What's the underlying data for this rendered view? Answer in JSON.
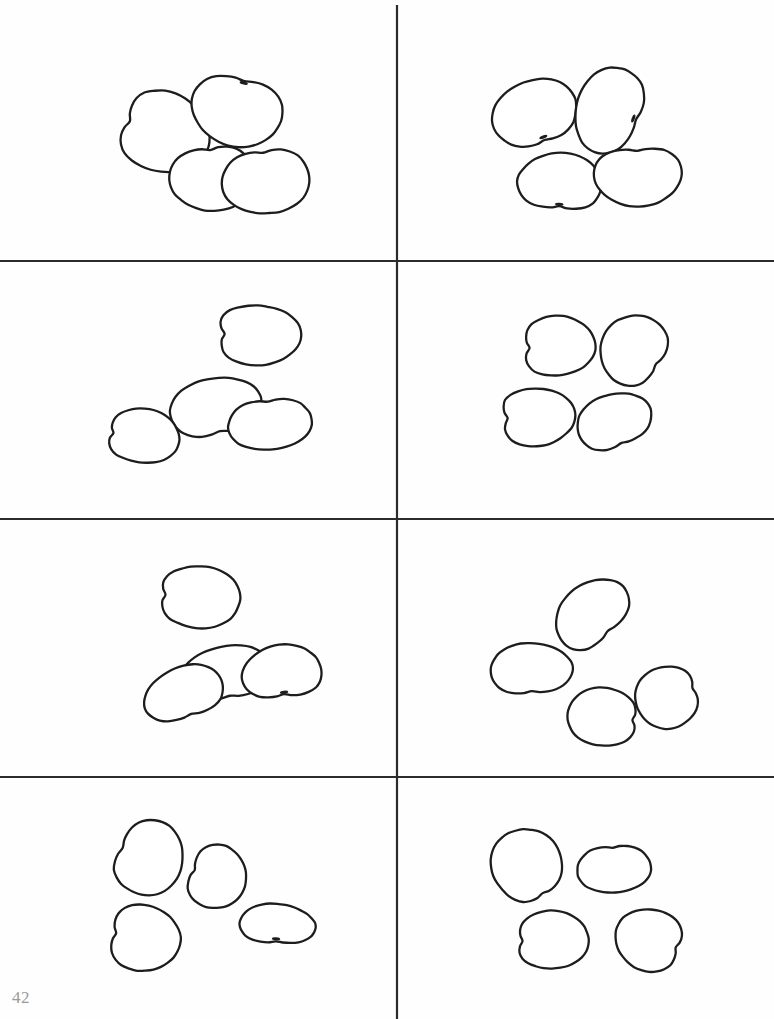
{
  "page": {
    "page_number": "42",
    "width": 774,
    "height": 1019,
    "background_color": "#fefefe",
    "ink_color": "#1d1d1d",
    "page_number_color": "#9a9a9a"
  },
  "grid": {
    "columns": 2,
    "rows": 4,
    "line_color": "#2b2b2b",
    "line_width": 2.2,
    "vertical_lines": [
      {
        "x": 397,
        "y1": 5,
        "y2": 1019
      }
    ],
    "horizontal_lines": [
      {
        "y": 261,
        "x1": 0,
        "x2": 774
      },
      {
        "y": 519,
        "x1": 0,
        "x2": 774
      },
      {
        "y": 777,
        "x1": 0,
        "x2": 774
      }
    ]
  },
  "cells": [
    {
      "id": "cell-1",
      "row": 1,
      "column": 1,
      "object_name": "bean",
      "count": 4,
      "bounds": {
        "x": 0,
        "y": 0,
        "width": 397,
        "height": 261
      }
    },
    {
      "id": "cell-2",
      "row": 1,
      "column": 2,
      "object_name": "bean",
      "count": 4,
      "bounds": {
        "x": 397,
        "y": 0,
        "width": 377,
        "height": 261
      }
    },
    {
      "id": "cell-3",
      "row": 2,
      "column": 1,
      "object_name": "bean",
      "count": 4,
      "bounds": {
        "x": 0,
        "y": 261,
        "width": 397,
        "height": 258
      }
    },
    {
      "id": "cell-4",
      "row": 2,
      "column": 2,
      "object_name": "bean",
      "count": 4,
      "bounds": {
        "x": 397,
        "y": 261,
        "width": 377,
        "height": 258
      }
    },
    {
      "id": "cell-5",
      "row": 3,
      "column": 1,
      "object_name": "bean",
      "count": 4,
      "bounds": {
        "x": 0,
        "y": 519,
        "width": 397,
        "height": 258
      }
    },
    {
      "id": "cell-6",
      "row": 3,
      "column": 2,
      "object_name": "bean",
      "count": 4,
      "bounds": {
        "x": 397,
        "y": 519,
        "width": 377,
        "height": 258
      }
    },
    {
      "id": "cell-7",
      "row": 4,
      "column": 1,
      "object_name": "bean",
      "count": 4,
      "bounds": {
        "x": 0,
        "y": 777,
        "width": 397,
        "height": 242
      }
    },
    {
      "id": "cell-8",
      "row": 4,
      "column": 2,
      "object_name": "bean",
      "count": 4,
      "bounds": {
        "x": 397,
        "y": 777,
        "width": 377,
        "height": 242
      }
    }
  ],
  "beans": [
    {
      "cell": "cell-1",
      "index": 0,
      "cx": 163,
      "cy": 132,
      "rx": 47,
      "ry": 40,
      "rotation": 18,
      "notch": 0.46,
      "hilum": false
    },
    {
      "cell": "cell-1",
      "index": 1,
      "cx": 237,
      "cy": 110,
      "rx": 36,
      "ry": 46,
      "rotation": 104,
      "notch": 0.3,
      "hilum": true
    },
    {
      "cell": "cell-1",
      "index": 2,
      "cx": 212,
      "cy": 177,
      "rx": 34,
      "ry": 42,
      "rotation": 86,
      "notch": 0.38,
      "hilum": false
    },
    {
      "cell": "cell-1",
      "index": 3,
      "cx": 266,
      "cy": 180,
      "rx": 34,
      "ry": 44,
      "rotation": 84,
      "notch": 0.4,
      "hilum": false
    },
    {
      "cell": "cell-2",
      "index": 0,
      "cx": 535,
      "cy": 114,
      "rx": 34,
      "ry": 43,
      "rotation": 250,
      "notch": 0.4,
      "hilum": true
    },
    {
      "cell": "cell-2",
      "index": 1,
      "cx": 610,
      "cy": 110,
      "rx": 34,
      "ry": 44,
      "rotation": 200,
      "notch": 0.38,
      "hilum": true
    },
    {
      "cell": "cell-2",
      "index": 2,
      "cx": 560,
      "cy": 183,
      "rx": 30,
      "ry": 42,
      "rotation": 272,
      "notch": 0.4,
      "hilum": true
    },
    {
      "cell": "cell-2",
      "index": 3,
      "cx": 638,
      "cy": 175,
      "rx": 31,
      "ry": 44,
      "rotation": 88,
      "notch": 0.38,
      "hilum": false
    },
    {
      "cell": "cell-3",
      "index": 0,
      "cx": 257,
      "cy": 335,
      "rx": 44,
      "ry": 30,
      "rotation": 2,
      "notch": 0.5,
      "hilum": false
    },
    {
      "cell": "cell-3",
      "index": 1,
      "cx": 215,
      "cy": 408,
      "rx": 30,
      "ry": 46,
      "rotation": 258,
      "notch": 0.42,
      "hilum": false
    },
    {
      "cell": "cell-3",
      "index": 2,
      "cx": 270,
      "cy": 423,
      "rx": 27,
      "ry": 42,
      "rotation": 84,
      "notch": 0.44,
      "hilum": false
    },
    {
      "cell": "cell-3",
      "index": 3,
      "cx": 142,
      "cy": 436,
      "rx": 38,
      "ry": 27,
      "rotation": 6,
      "notch": 0.5,
      "hilum": false
    },
    {
      "cell": "cell-4",
      "index": 0,
      "cx": 557,
      "cy": 346,
      "rx": 38,
      "ry": 30,
      "rotation": 356,
      "notch": 0.5,
      "hilum": false
    },
    {
      "cell": "cell-4",
      "index": 1,
      "cx": 634,
      "cy": 350,
      "rx": 33,
      "ry": 36,
      "rotation": 214,
      "notch": 0.36,
      "hilum": false
    },
    {
      "cell": "cell-4",
      "index": 2,
      "cx": 536,
      "cy": 417,
      "rx": 39,
      "ry": 29,
      "rotation": 358,
      "notch": 0.5,
      "hilum": false
    },
    {
      "cell": "cell-4",
      "index": 3,
      "cx": 614,
      "cy": 422,
      "rx": 28,
      "ry": 38,
      "rotation": 250,
      "notch": 0.42,
      "hilum": false
    },
    {
      "cell": "cell-5",
      "index": 0,
      "cx": 198,
      "cy": 597,
      "rx": 43,
      "ry": 31,
      "rotation": 4,
      "notch": 0.5,
      "hilum": false
    },
    {
      "cell": "cell-5",
      "index": 1,
      "cx": 226,
      "cy": 674,
      "rx": 28,
      "ry": 45,
      "rotation": 260,
      "notch": 0.44,
      "hilum": false
    },
    {
      "cell": "cell-5",
      "index": 2,
      "cx": 184,
      "cy": 694,
      "rx": 27,
      "ry": 41,
      "rotation": 250,
      "notch": 0.42,
      "hilum": false
    },
    {
      "cell": "cell-5",
      "index": 3,
      "cx": 282,
      "cy": 673,
      "rx": 28,
      "ry": 40,
      "rotation": 264,
      "notch": 0.42,
      "hilum": true
    },
    {
      "cell": "cell-6",
      "index": 0,
      "cx": 592,
      "cy": 614,
      "rx": 30,
      "ry": 41,
      "rotation": 228,
      "notch": 0.4,
      "hilum": false
    },
    {
      "cell": "cell-6",
      "index": 1,
      "cx": 531,
      "cy": 670,
      "rx": 27,
      "ry": 41,
      "rotation": 268,
      "notch": 0.42,
      "hilum": false
    },
    {
      "cell": "cell-6",
      "index": 2,
      "cx": 604,
      "cy": 717,
      "rx": 37,
      "ry": 29,
      "rotation": 186,
      "notch": 0.46,
      "hilum": false
    },
    {
      "cell": "cell-6",
      "index": 3,
      "cx": 668,
      "cy": 697,
      "rx": 33,
      "ry": 31,
      "rotation": 160,
      "notch": 0.44,
      "hilum": false
    },
    {
      "cell": "cell-7",
      "index": 0,
      "cx": 148,
      "cy": 858,
      "rx": 35,
      "ry": 38,
      "rotation": 22,
      "notch": 0.44,
      "hilum": false
    },
    {
      "cell": "cell-7",
      "index": 1,
      "cx": 216,
      "cy": 877,
      "rx": 30,
      "ry": 32,
      "rotation": 18,
      "notch": 0.44,
      "hilum": false
    },
    {
      "cell": "cell-7",
      "index": 2,
      "cx": 143,
      "cy": 938,
      "rx": 37,
      "ry": 33,
      "rotation": 10,
      "notch": 0.46,
      "hilum": false
    },
    {
      "cell": "cell-7",
      "index": 3,
      "cx": 277,
      "cy": 925,
      "rx": 21,
      "ry": 38,
      "rotation": 274,
      "notch": 0.42,
      "hilum": true
    },
    {
      "cell": "cell-8",
      "index": 0,
      "cx": 527,
      "cy": 866,
      "rx": 38,
      "ry": 35,
      "rotation": 240,
      "notch": 0.38,
      "hilum": false
    },
    {
      "cell": "cell-8",
      "index": 1,
      "cx": 614,
      "cy": 868,
      "rx": 25,
      "ry": 37,
      "rotation": 86,
      "notch": 0.4,
      "hilum": false
    },
    {
      "cell": "cell-8",
      "index": 2,
      "cx": 551,
      "cy": 940,
      "rx": 38,
      "ry": 29,
      "rotation": 358,
      "notch": 0.5,
      "hilum": false
    },
    {
      "cell": "cell-8",
      "index": 3,
      "cx": 650,
      "cy": 940,
      "rx": 35,
      "ry": 31,
      "rotation": 196,
      "notch": 0.44,
      "hilum": false
    }
  ]
}
